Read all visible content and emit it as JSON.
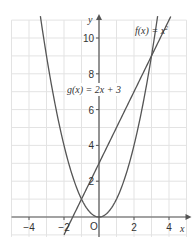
{
  "chart_data": {
    "type": "line",
    "title": "",
    "xlabel": "x",
    "ylabel": "y",
    "xlim": [
      -5,
      5
    ],
    "ylim": [
      -1,
      11
    ],
    "grid": true,
    "origin_label": "O",
    "x_ticks": [
      {
        "value": -4,
        "label": "−4"
      },
      {
        "value": -2,
        "label": "−2"
      },
      {
        "value": 2,
        "label": "2"
      },
      {
        "value": 4,
        "label": "4"
      }
    ],
    "y_ticks": [
      {
        "value": 2,
        "label": "2"
      },
      {
        "value": 4,
        "label": "4"
      },
      {
        "value": 6,
        "label": "6"
      },
      {
        "value": 8,
        "label": "8"
      },
      {
        "value": 10,
        "label": "10"
      }
    ],
    "series": [
      {
        "name": "f(x) = x²",
        "expression": "x^2",
        "kind": "parabola",
        "x_range": [
          -3.35,
          3.35
        ]
      },
      {
        "name": "g(x) = 2x + 3",
        "expression": "2x+3",
        "kind": "line",
        "x_range": [
          -2.0,
          4.1
        ]
      }
    ],
    "annotations": [
      {
        "text": "f(x) = x²",
        "near": [
          2.8,
          10.5
        ]
      },
      {
        "text": "g(x) = 2x + 3",
        "near": [
          -0.9,
          7.0
        ]
      }
    ],
    "intersections": [
      [
        -1,
        1
      ],
      [
        3,
        9
      ]
    ],
    "colors": {
      "grid": "#e3e3e3",
      "axes": "#555555",
      "curves": "#555555"
    }
  },
  "labels": {
    "f_prefix": "f(x) = x",
    "f_sup": "2",
    "g_label": "g(x) = 2x + 3",
    "x_axis": "x",
    "y_axis": "y",
    "origin": "O"
  }
}
